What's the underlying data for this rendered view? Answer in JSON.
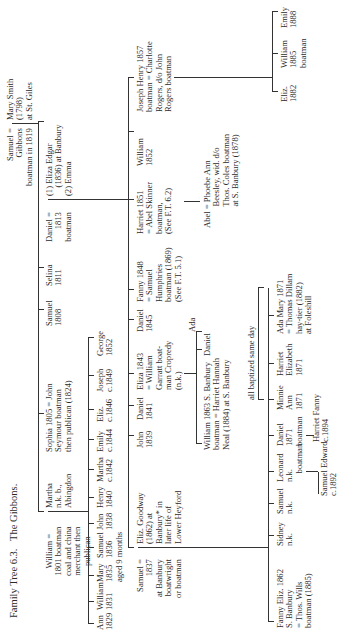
{
  "caption": "Family Tree 6.3.   The Gibbons.",
  "gen1": {
    "samuel": "Samuel =\nGibbons\nboatman in 1819",
    "mary": "Mary Smith\n(1798)\nat St. Giles"
  },
  "gen2": [
    {
      "id": "william",
      "text": "William =\n1801 boatman\ncoal and china\nmerchant then\npublican"
    },
    {
      "id": "martha",
      "text": "Martha\nn.k. b.,\nAbingdon"
    },
    {
      "id": "sophia",
      "text": "Sophia 1805 = John\nSeymour boatman\nthen publican (1824)"
    },
    {
      "id": "samuel",
      "text": "Samuel\n1808"
    },
    {
      "id": "selina",
      "text": "Selina\n1811"
    },
    {
      "id": "daniel",
      "text": "Daniel =\n1813\nboatman"
    },
    {
      "id": "eliza",
      "text": "(1) Eliza Edgar\n    (1836) at Banbury\n(2) Emma"
    }
  ],
  "gen3_william": [
    {
      "id": "ann",
      "text": "Ann\n1829"
    },
    {
      "id": "william",
      "text": "William\n1831"
    },
    {
      "id": "mary",
      "text": "Mary\n1835\naged 9 months"
    },
    {
      "id": "samuel",
      "text": "Samuel\n1836"
    },
    {
      "id": "john",
      "text": "John\n1838"
    },
    {
      "id": "henry",
      "text": "Henry\n1840"
    },
    {
      "id": "martha",
      "text": "Martha\nc.1842"
    },
    {
      "id": "emily",
      "text": "Emily\nc.1844"
    },
    {
      "id": "eliz",
      "text": "Eliz.\nc.1846"
    },
    {
      "id": "joseph",
      "text": "Joseph\nc.1849"
    },
    {
      "id": "george",
      "text": "George\n1852"
    }
  ],
  "gen3_daniel": [
    {
      "id": "samuel",
      "text": "Samuel =\n1837\nat Banbury\nboatwright\nor boatman"
    },
    {
      "id": "eliz-goodway",
      "text": "Eliz. Goodway\n(1862) at\nBanbury* in\nlater life of\nLower Heyford"
    },
    {
      "id": "john",
      "text": "John\n1839"
    },
    {
      "id": "daniel",
      "text": "Daniel\n1841"
    },
    {
      "id": "eliza",
      "text": "Eliza 1843\n= William\nGarratt boat-\nman Cropredy\n(n.k.)"
    },
    {
      "id": "daniel2",
      "text": "Daniel\n1845"
    },
    {
      "id": "fanny",
      "text": "Fanny 1848\n= Samuel\nHumphries\nboatman (1869)\n(See F.T. 5.1)"
    },
    {
      "id": "harriet",
      "text": "Harriet 1851\n= Abel Skinner\nboatman,\n(See F.T. 6.2)"
    },
    {
      "id": "william",
      "text": "William\n1852"
    },
    {
      "id": "joseph-henry",
      "text": "Joseph Henry 1857\nboatman = Charlotte\nRogers, d/o John\nRogers boatman"
    }
  ],
  "gen4_eliza": [
    {
      "id": "william",
      "text": "William 1863 S. Banbury\nboatman = Harriet Hannah\nNeal (1884) at S. Banbury"
    },
    {
      "id": "daniel",
      "text": "Daniel"
    },
    {
      "id": "ada",
      "text": "Ada"
    }
  ],
  "gen4_harriet": {
    "abel": "Abel = Phoebe Ann\n          Beesley, wid. d/o\n          Thos. Coles boatman\n          at S. Banbury (1878)"
  },
  "gen4_joseph": [
    {
      "id": "eliz",
      "text": "Eliz.\n1882"
    },
    {
      "id": "william",
      "text": "William\n1885\nboatman"
    },
    {
      "id": "emily",
      "text": "Emily\n1888"
    }
  ],
  "gen4_samuel": [
    {
      "id": "fanny",
      "text": "Fanny Eliz. 1862\nS. Banbury\n= Thos. Wills\nboatman (1885)"
    },
    {
      "id": "sidney",
      "text": "Sidney\nn.k."
    },
    {
      "id": "samuel",
      "text": "Samuel\nn.k."
    },
    {
      "id": "leonard",
      "text": "Leonard\nn.k.\n    boatman"
    },
    {
      "id": "daniel",
      "text": "Daniel\n1871\nboatman"
    },
    {
      "id": "minnie",
      "text": "Minnie\nAnn\n1871"
    },
    {
      "id": "harriet",
      "text": "Harriet\nElizabeth\n1871"
    },
    {
      "id": "ada-mary",
      "text": "Ada Mary 1871\n= Thomas Dillam\nhay-tier (1882)\nat Foleshill"
    }
  ],
  "baptized_note": "all baptized same day",
  "gen5_leonard": {
    "text": "Samuel Edward\nc.1892"
  },
  "gen5_daniel": {
    "text": "Harriet Fanny\nc.1894"
  }
}
